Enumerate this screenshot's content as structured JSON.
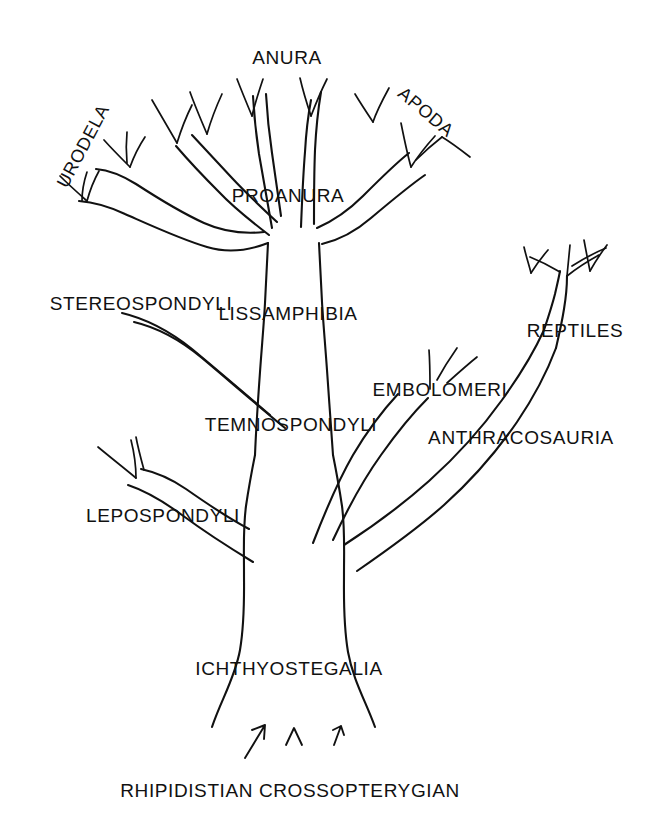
{
  "figure": {
    "kind": "phylogenetic-tree-diagram",
    "background_color": "#ffffff",
    "line_color": "#111111"
  },
  "labels": {
    "anura": "ANURA",
    "urodela": "URODELA",
    "apoda": "APODA",
    "proanura": "PROANURA",
    "stereospondyli": "STEREOSPONDYLI",
    "lissamphibia": "LISSAMPHIBIA",
    "reptiles": "REPTILES",
    "embolomeri": "EMBOLOMERI",
    "temnospondyli": "TEMNOSPONDYLI",
    "anthracosauria": "ANTHRACOSAURIA",
    "lepospondyli": "LEPOSPONDYLI",
    "ichthyostegalia": "ICHTHYOSTEGALIA",
    "rhipidistian": "RHIPIDISTIAN CROSSOPTERYGIAN"
  },
  "taxa": [
    {
      "name": "ANURA",
      "role": "crown-tip",
      "x": 287,
      "y": 57,
      "rotation": 0,
      "font_size": 19
    },
    {
      "name": "URODELA",
      "role": "crown-tip",
      "x": 83,
      "y": 146,
      "rotation": -62,
      "font_size": 18
    },
    {
      "name": "APODA",
      "role": "crown-tip",
      "x": 426,
      "y": 112,
      "rotation": 40,
      "font_size": 18
    },
    {
      "name": "PROANURA",
      "role": "internal",
      "x": 288,
      "y": 195,
      "rotation": 0,
      "font_size": 19
    },
    {
      "name": "STEREOSPONDYLI",
      "role": "side-branch",
      "x": 141,
      "y": 303,
      "rotation": 0,
      "font_size": 19
    },
    {
      "name": "LISSAMPHIBIA",
      "role": "internal",
      "x": 288,
      "y": 313,
      "rotation": 0,
      "font_size": 19
    },
    {
      "name": "REPTILES",
      "role": "crown-tip",
      "x": 575,
      "y": 330,
      "rotation": 0,
      "font_size": 19
    },
    {
      "name": "EMBOLOMERI",
      "role": "side-branch",
      "x": 440,
      "y": 389,
      "rotation": 0,
      "font_size": 19
    },
    {
      "name": "TEMNOSPONDYLI",
      "role": "internal",
      "x": 291,
      "y": 424,
      "rotation": 0,
      "font_size": 19
    },
    {
      "name": "ANTHRACOSAURIA",
      "role": "internal",
      "x": 521,
      "y": 437,
      "rotation": 0,
      "font_size": 19
    },
    {
      "name": "LEPOSPONDYLI",
      "role": "side-branch",
      "x": 163,
      "y": 515,
      "rotation": 0,
      "font_size": 19
    },
    {
      "name": "ICHTHYOSTEGALIA",
      "role": "internal",
      "x": 289,
      "y": 668,
      "rotation": 0,
      "font_size": 19
    },
    {
      "name": "RHIPIDISTIAN CROSSOPTERYGIAN",
      "role": "root",
      "x": 290,
      "y": 790,
      "rotation": 0,
      "font_size": 19
    }
  ],
  "structure": {
    "root_arrows": 3,
    "trunk_label": "ICHTHYOSTEGALIA",
    "major_clades": [
      "LISSAMPHIBIA",
      "TEMNOSPONDYLI",
      "ANTHRACOSAURIA",
      "LEPOSPONDYLI"
    ],
    "terminal_clades": [
      "ANURA",
      "URODELA",
      "APODA",
      "REPTILES",
      "STEREOSPONDYLI",
      "EMBOLOMERI"
    ]
  }
}
